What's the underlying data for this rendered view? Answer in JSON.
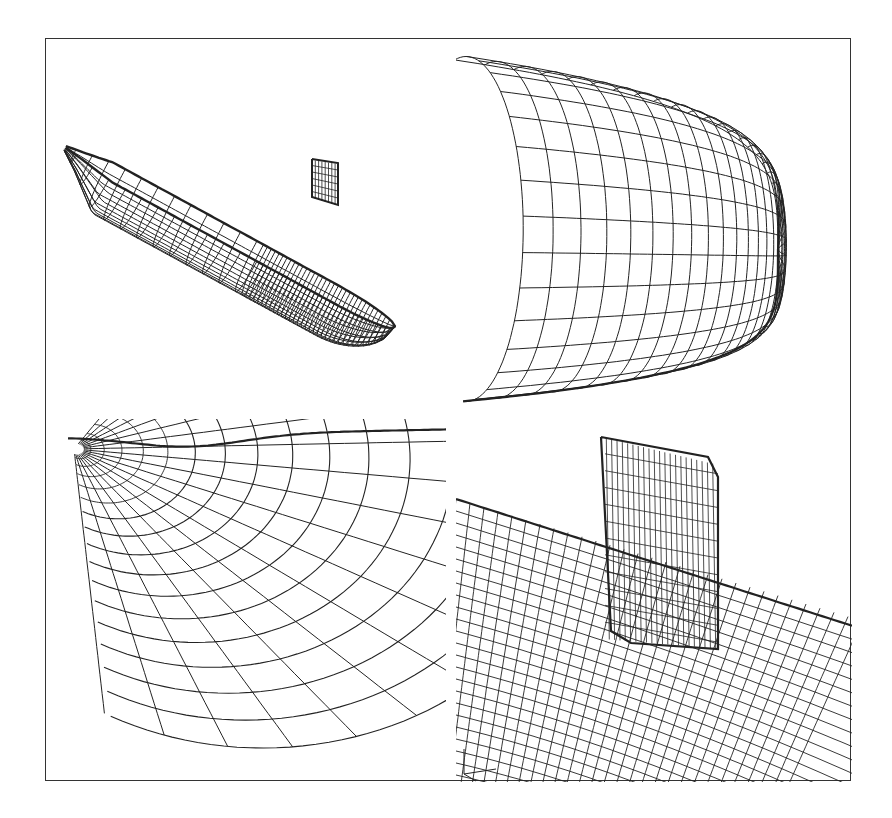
{
  "figure": {
    "line_color": "#222222",
    "background": "#ffffff",
    "frame_color": "#333333",
    "panels": [
      {
        "id": "full-hull",
        "label": "Full submarine hull with sail (isometric view)"
      },
      {
        "id": "bow-closeup",
        "label": "Close-up of bow mesh"
      },
      {
        "id": "stern-closeup",
        "label": "Close-up of stern / tail mesh"
      },
      {
        "id": "sail-closeup",
        "label": "Close-up of sail (fin) junction with hull"
      }
    ],
    "axis_triad": {
      "visible": true,
      "panel": "sail-closeup",
      "position": "bottom-left"
    }
  }
}
